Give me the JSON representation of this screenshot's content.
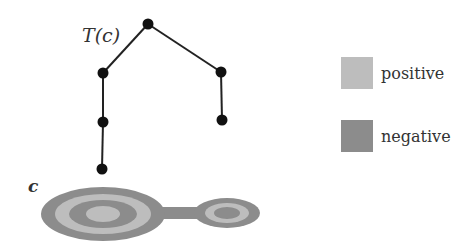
{
  "labels": {
    "tree": "T(c)",
    "shape": "c"
  },
  "colors": {
    "positive": "#bdbdbd",
    "negative": "#8c8c8c",
    "node": "#111111",
    "edge": "#222222"
  },
  "legend": [
    {
      "label": "positive",
      "color": "#bdbdbd"
    },
    {
      "label": "negative",
      "color": "#8c8c8c"
    }
  ],
  "tree": {
    "nodes": [
      {
        "id": "root",
        "x": 148,
        "y": 24
      },
      {
        "id": "l1",
        "x": 103,
        "y": 73
      },
      {
        "id": "r1",
        "x": 221,
        "y": 72
      },
      {
        "id": "l2",
        "x": 103,
        "y": 122
      },
      {
        "id": "r2",
        "x": 222,
        "y": 120
      },
      {
        "id": "l3",
        "x": 102,
        "y": 169
      }
    ],
    "edges": [
      [
        "root",
        "l1"
      ],
      [
        "root",
        "r1"
      ],
      [
        "l1",
        "l2"
      ],
      [
        "l2",
        "l3"
      ],
      [
        "r1",
        "r2"
      ]
    ]
  },
  "shape": {
    "large": {
      "cx": 103,
      "cy": 214,
      "rings": [
        [
          62,
          27,
          "negative"
        ],
        [
          48,
          20,
          "positive"
        ],
        [
          34,
          14,
          "negative"
        ],
        [
          17,
          8,
          "positive"
        ]
      ]
    },
    "small": {
      "cx": 227,
      "cy": 213,
      "rings": [
        [
          33,
          15,
          "negative"
        ],
        [
          22,
          10,
          "positive"
        ],
        [
          13,
          6,
          "negative"
        ]
      ]
    },
    "bridge": {
      "x": 160,
      "y": 207,
      "w": 40,
      "h": 12,
      "type": "negative"
    }
  }
}
